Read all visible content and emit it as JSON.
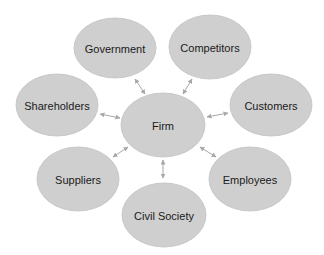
{
  "diagram": {
    "type": "stakeholder-hub",
    "center": {
      "id": "firm",
      "label": "Firm",
      "cx": 163,
      "cy": 125,
      "rx": 42,
      "ry": 32
    },
    "nodes": [
      {
        "id": "government",
        "label": "Government",
        "cx": 115,
        "cy": 48,
        "rx": 41,
        "ry": 30
      },
      {
        "id": "competitors",
        "label": "Competitors",
        "cx": 210,
        "cy": 47,
        "rx": 41,
        "ry": 32
      },
      {
        "id": "shareholders",
        "label": "Shareholders",
        "cx": 57,
        "cy": 105,
        "rx": 41,
        "ry": 31
      },
      {
        "id": "customers",
        "label": "Customers",
        "cx": 271,
        "cy": 105,
        "rx": 41,
        "ry": 31
      },
      {
        "id": "suppliers",
        "label": "Suppliers",
        "cx": 78,
        "cy": 179,
        "rx": 41,
        "ry": 32
      },
      {
        "id": "employees",
        "label": "Employees",
        "cx": 250,
        "cy": 179,
        "rx": 41,
        "ry": 32
      },
      {
        "id": "civil-society",
        "label": "Civil Society",
        "cx": 164,
        "cy": 215,
        "rx": 42,
        "ry": 32
      }
    ],
    "edges": [
      {
        "from": "government",
        "to": "firm",
        "x1": 135,
        "y1": 79,
        "x2": 145,
        "y2": 94,
        "bidirectional": true
      },
      {
        "from": "competitors",
        "to": "firm",
        "x1": 192,
        "y1": 79,
        "x2": 183,
        "y2": 94,
        "bidirectional": true
      },
      {
        "from": "shareholders",
        "to": "firm",
        "x1": 100,
        "y1": 114,
        "x2": 120,
        "y2": 118,
        "bidirectional": true
      },
      {
        "from": "customers",
        "to": "firm",
        "x1": 228,
        "y1": 113,
        "x2": 207,
        "y2": 117,
        "bidirectional": true
      },
      {
        "from": "suppliers",
        "to": "firm",
        "x1": 113,
        "y1": 157,
        "x2": 128,
        "y2": 147,
        "bidirectional": true
      },
      {
        "from": "employees",
        "to": "firm",
        "x1": 216,
        "y1": 157,
        "x2": 200,
        "y2": 147,
        "bidirectional": true
      },
      {
        "from": "civil-society",
        "to": "firm",
        "x1": 163,
        "y1": 178,
        "x2": 163,
        "y2": 160,
        "bidirectional": true
      }
    ],
    "colors": {
      "node_fill": "#cfcfcf",
      "node_stroke": "#c2c2c2",
      "arrow": "#a8a8a8",
      "text": "#1a1a1a",
      "background": "#ffffff"
    }
  }
}
